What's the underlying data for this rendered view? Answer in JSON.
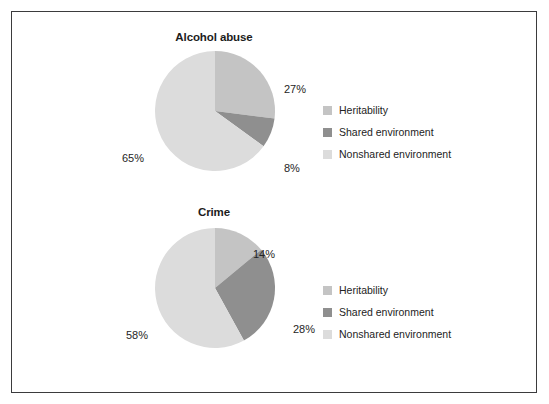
{
  "figure": {
    "border_color": "#3b3b3d",
    "background": "#ffffff"
  },
  "palette": {
    "heritability": "#c4c4c4",
    "shared_environment": "#8f8f8f",
    "nonshared_environment": "#dcdcdc"
  },
  "legend": {
    "items": [
      {
        "label": "Heritability",
        "color": "#c4c4c4"
      },
      {
        "label": "Shared environment",
        "color": "#8f8f8f"
      },
      {
        "label": "Nonshared environment",
        "color": "#dcdcdc"
      }
    ]
  },
  "charts": [
    {
      "title": "Alcohol abuse",
      "labels": [
        "27%",
        "8%",
        "65%"
      ]
    },
    {
      "title": "Crime",
      "labels": [
        "14%",
        "28%",
        "58%"
      ]
    }
  ],
  "chart_data": [
    {
      "type": "pie",
      "title": "Alcohol abuse",
      "categories": [
        "Heritability",
        "Shared environment",
        "Nonshared environment"
      ],
      "values": [
        27,
        8,
        65
      ],
      "value_labels": [
        "27%",
        "8%",
        "65%"
      ],
      "colors": [
        "#c4c4c4",
        "#8f8f8f",
        "#dcdcdc"
      ],
      "units": "percent",
      "start_angle_deg": 0,
      "direction": "clockwise",
      "legend_position": "right",
      "grid": false
    },
    {
      "type": "pie",
      "title": "Crime",
      "categories": [
        "Heritability",
        "Shared environment",
        "Nonshared environment"
      ],
      "values": [
        14,
        28,
        58
      ],
      "value_labels": [
        "14%",
        "28%",
        "58%"
      ],
      "colors": [
        "#c4c4c4",
        "#8f8f8f",
        "#dcdcdc"
      ],
      "units": "percent",
      "start_angle_deg": 0,
      "direction": "clockwise",
      "legend_position": "right",
      "grid": false
    }
  ]
}
